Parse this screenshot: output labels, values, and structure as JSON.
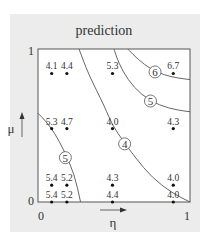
{
  "chart_data": {
    "type": "scatter",
    "title": "prediction",
    "xlabel": "η",
    "ylabel": "μ",
    "xlim": [
      0,
      1
    ],
    "ylim": [
      0,
      1
    ],
    "x_ticks": [
      "0",
      "1"
    ],
    "y_ticks": [
      "0",
      "1"
    ],
    "grid": false,
    "legend": "none",
    "points": [
      {
        "x": 0.09,
        "y": 0.84,
        "label": "4.1"
      },
      {
        "x": 0.19,
        "y": 0.84,
        "label": "4.4"
      },
      {
        "x": 0.49,
        "y": 0.84,
        "label": "5.3"
      },
      {
        "x": 0.89,
        "y": 0.84,
        "label": "6.7"
      },
      {
        "x": 0.09,
        "y": 0.48,
        "label": "5.3"
      },
      {
        "x": 0.19,
        "y": 0.48,
        "label": "4.7"
      },
      {
        "x": 0.49,
        "y": 0.48,
        "label": "4.0"
      },
      {
        "x": 0.89,
        "y": 0.48,
        "label": "4.3"
      },
      {
        "x": 0.09,
        "y": 0.11,
        "label": "5.4"
      },
      {
        "x": 0.19,
        "y": 0.11,
        "label": "5.2"
      },
      {
        "x": 0.49,
        "y": 0.11,
        "label": "4.3"
      },
      {
        "x": 0.89,
        "y": 0.11,
        "label": "4.0"
      },
      {
        "x": 0.09,
        "y": 0.0,
        "label": "5.4"
      },
      {
        "x": 0.19,
        "y": 0.0,
        "label": "5.2"
      },
      {
        "x": 0.49,
        "y": 0.0,
        "label": "4.4"
      },
      {
        "x": 0.89,
        "y": 0.0,
        "label": "4.0"
      }
    ],
    "contours": [
      {
        "level": "6",
        "path": [
          [
            0.59,
            1.0
          ],
          [
            0.66,
            0.93
          ],
          [
            0.74,
            0.87
          ],
          [
            0.83,
            0.83
          ],
          [
            0.92,
            0.81
          ],
          [
            1.0,
            0.8
          ]
        ],
        "label_at": [
          0.77,
          0.85
        ]
      },
      {
        "level": "5",
        "path": [
          [
            0.5,
            1.0
          ],
          [
            0.53,
            0.91
          ],
          [
            0.59,
            0.8
          ],
          [
            0.68,
            0.7
          ],
          [
            0.8,
            0.63
          ],
          [
            0.92,
            0.6
          ],
          [
            1.0,
            0.59
          ]
        ],
        "label_at": [
          0.74,
          0.66
        ]
      },
      {
        "level": "4",
        "path": [
          [
            0.27,
            1.0
          ],
          [
            0.33,
            0.84
          ],
          [
            0.44,
            0.62
          ],
          [
            0.49,
            0.5
          ],
          [
            0.56,
            0.4
          ],
          [
            0.64,
            0.29
          ],
          [
            0.75,
            0.16
          ],
          [
            0.88,
            0.06
          ],
          [
            1.0,
            0.0
          ]
        ],
        "label_at": [
          0.57,
          0.38
        ]
      },
      {
        "level": "5",
        "path": [
          [
            0.0,
            0.58
          ],
          [
            0.05,
            0.53
          ],
          [
            0.11,
            0.45
          ],
          [
            0.17,
            0.34
          ],
          [
            0.24,
            0.18
          ],
          [
            0.28,
            0.0
          ]
        ],
        "label_at": [
          0.18,
          0.29
        ]
      }
    ]
  }
}
